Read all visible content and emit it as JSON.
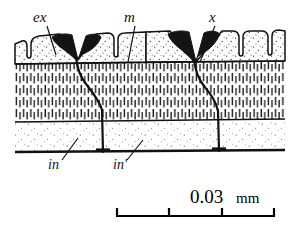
{
  "figure": {
    "type": "histological-cross-section",
    "labels": [
      {
        "id": "ex",
        "text": "ex",
        "x": 33,
        "y": 22,
        "leader": {
          "x1": 47,
          "y1": 26,
          "x2": 56,
          "y2": 55
        }
      },
      {
        "id": "m",
        "text": "m",
        "x": 124,
        "y": 22,
        "leader": {
          "x1": 135,
          "y1": 26,
          "x2": 128,
          "y2": 62
        }
      },
      {
        "id": "x",
        "text": "x",
        "x": 209,
        "y": 22,
        "leader": {
          "x1": 215,
          "y1": 26,
          "x2": 200,
          "y2": 62
        }
      },
      {
        "id": "in",
        "text": "in",
        "x": 48,
        "y": 169,
        "leader": {
          "x1": 62,
          "y1": 160,
          "x2": 78,
          "y2": 138
        }
      },
      {
        "id": "in2",
        "text": "in'",
        "x": 113,
        "y": 169,
        "leader": {
          "x1": 127,
          "y1": 160,
          "x2": 143,
          "y2": 140
        }
      }
    ],
    "layers": [
      {
        "name": "outer-epidermis-layer",
        "top": 30,
        "bottom": 63,
        "fill": "stipple"
      },
      {
        "name": "middle-columnar-layer",
        "top": 63,
        "bottom": 121,
        "fill": "vertical-dash-hatch"
      },
      {
        "name": "inner-basal-layer",
        "top": 121,
        "bottom": 152,
        "fill": "fine-stipple"
      }
    ],
    "dark_structures": [
      {
        "name": "dark-wedge-left",
        "apex_x": 78,
        "apex_y": 60
      },
      {
        "name": "dark-wedge-right",
        "apex_x": 196,
        "apex_y": 62
      }
    ],
    "canals": [
      {
        "name": "canal-left",
        "from_x": 78,
        "to_x": 103,
        "top": 58,
        "bottom": 152
      },
      {
        "name": "canal-right",
        "from_x": 196,
        "to_x": 219,
        "top": 60,
        "bottom": 152
      }
    ],
    "colors": {
      "ink": "#111111",
      "paper": "#ffffff",
      "dark_fill": "#151515"
    }
  },
  "scale_bar": {
    "label_value": "0.03",
    "label_unit": "mm",
    "x_start": 116,
    "x_end": 275,
    "y": 216,
    "tick_count": 4,
    "divisions": 3
  }
}
